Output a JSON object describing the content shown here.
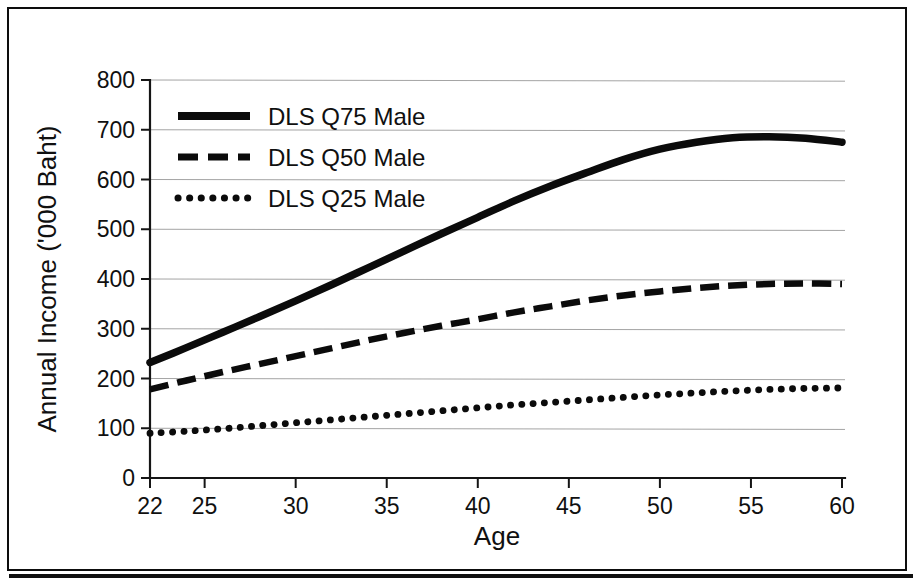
{
  "chart_data": {
    "type": "line",
    "title": "",
    "xlabel": "Age",
    "ylabel": "Annual Income ('000 Baht)",
    "xlim": [
      22,
      60
    ],
    "ylim": [
      0,
      800
    ],
    "grid": true,
    "legend_position": "top-left",
    "x_ticks": [
      "22",
      "25",
      "30",
      "35",
      "40",
      "45",
      "50",
      "55",
      "60"
    ],
    "x_tick_values": [
      22,
      25,
      30,
      35,
      40,
      45,
      50,
      55,
      60
    ],
    "y_ticks": [
      "0",
      "100",
      "200",
      "300",
      "400",
      "500",
      "600",
      "700",
      "800"
    ],
    "y_tick_values": [
      0,
      100,
      200,
      300,
      400,
      500,
      600,
      700,
      800
    ],
    "x": [
      22,
      24,
      26,
      28,
      30,
      32,
      34,
      36,
      38,
      40,
      42,
      44,
      46,
      48,
      50,
      52,
      54,
      56,
      58,
      60
    ],
    "series": [
      {
        "name": "DLS Q75 Male",
        "style": "solid",
        "color": "#0b0b0b",
        "values": [
          232,
          262,
          293,
          324,
          356,
          389,
          423,
          457,
          491,
          524,
          557,
          587,
          614,
          640,
          661,
          675,
          684,
          686,
          683,
          675
        ]
      },
      {
        "name": "DLS Q50 Male",
        "style": "dashed",
        "color": "#0b0b0b",
        "values": [
          178,
          196,
          213,
          229,
          245,
          261,
          277,
          292,
          306,
          319,
          333,
          345,
          357,
          367,
          375,
          382,
          387,
          390,
          391,
          390
        ]
      },
      {
        "name": "DLS Q25 Male",
        "style": "dotted",
        "color": "#0b0b0b",
        "values": [
          90,
          94,
          99,
          105,
          111,
          117,
          123,
          129,
          135,
          141,
          147,
          152,
          157,
          162,
          167,
          171,
          175,
          178,
          180,
          181
        ]
      }
    ]
  },
  "legend": {
    "items": [
      {
        "label": "DLS Q75 Male",
        "style": "solid"
      },
      {
        "label": "DLS Q50 Male",
        "style": "dashed"
      },
      {
        "label": "DLS Q25 Male",
        "style": "dotted"
      }
    ]
  }
}
